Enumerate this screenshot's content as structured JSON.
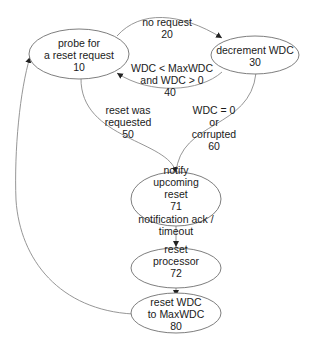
{
  "diagram": {
    "type": "state-machine",
    "nodes": [
      {
        "id": "10",
        "lines": [
          "probe for",
          "a reset request",
          "10"
        ]
      },
      {
        "id": "30",
        "lines": [
          "decrement WDC",
          "30"
        ]
      },
      {
        "id": "71",
        "lines": [
          "notify",
          "upcoming",
          "reset",
          "71"
        ]
      },
      {
        "id": "72",
        "lines": [
          "reset",
          "processor",
          "72"
        ]
      },
      {
        "id": "80",
        "lines": [
          "reset WDC",
          "to MaxWDC",
          "80"
        ]
      }
    ],
    "edges": [
      {
        "from": "10",
        "to": "30",
        "lines": [
          "no request",
          "20"
        ]
      },
      {
        "from": "30",
        "to": "10",
        "lines": [
          "WDC < MaxWDC",
          "and WDC > 0",
          "40"
        ]
      },
      {
        "from": "10",
        "to": "71",
        "lines": [
          "reset was",
          "requested",
          "50"
        ]
      },
      {
        "from": "30",
        "to": "71",
        "lines": [
          "WDC = 0",
          "or",
          "corrupted",
          "60"
        ]
      },
      {
        "from": "71",
        "to": "72",
        "lines": [
          "notification ack /",
          "timeout"
        ]
      },
      {
        "from": "72",
        "to": "80",
        "lines": []
      },
      {
        "from": "80",
        "to": "10",
        "lines": []
      }
    ]
  }
}
